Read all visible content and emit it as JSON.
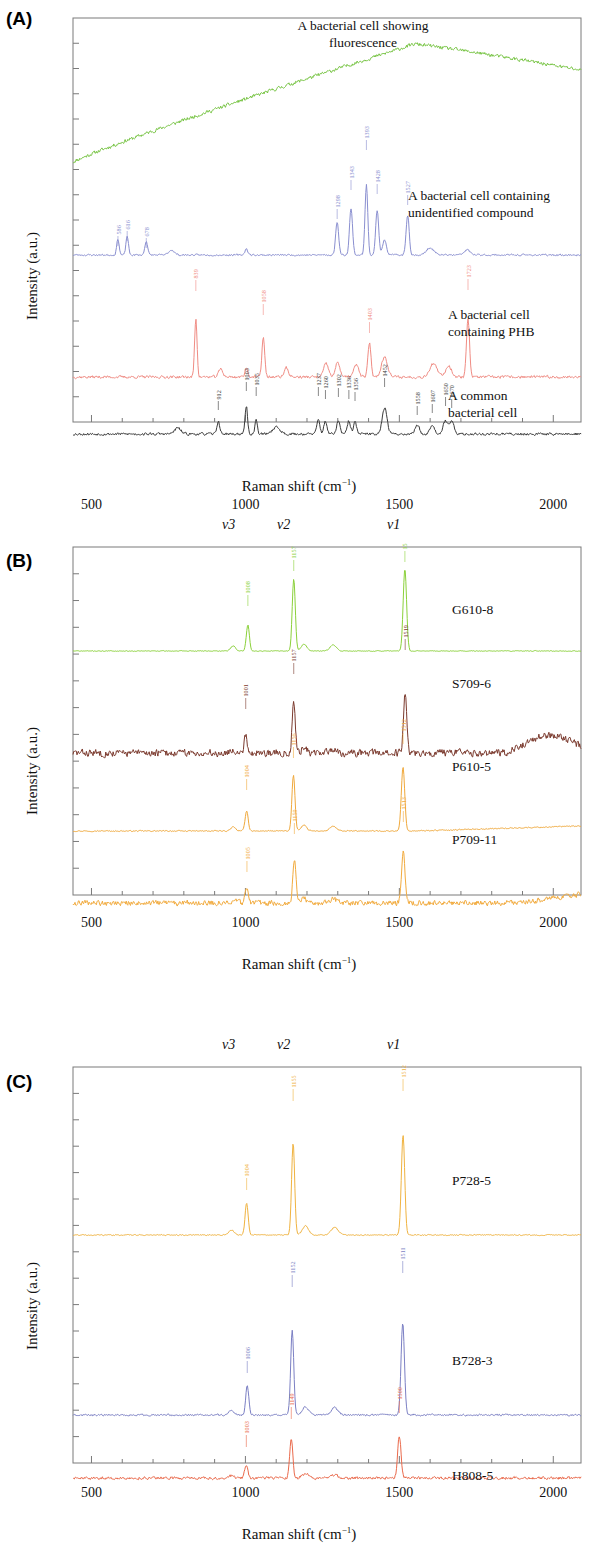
{
  "figure": {
    "axis_y_title": "Intensity (a.u.)",
    "axis_x_title_main": "Raman shift (cm",
    "axis_x_title_sup": "−1",
    "axis_x_title_tail": ")",
    "x_ticks": [
      "500",
      "1000",
      "1500",
      "2000"
    ],
    "x_range": [
      440,
      2090
    ]
  },
  "panelA": {
    "letter": "(A)",
    "series": [
      {
        "name": "A bacterial cell showing fluorescence",
        "label_lines": [
          "A bacterial cell showing",
          "fluorescence"
        ],
        "color": "#76c442",
        "peaks": []
      },
      {
        "name": "A bacterial cell containing unidentified compound",
        "label_lines": [
          "A bacterial cell containing",
          "unidentified compound"
        ],
        "color": "#8a8fd0",
        "peaks": [
          "586",
          "616",
          "678",
          "1298",
          "1343",
          "1393",
          "1428",
          "1527"
        ]
      },
      {
        "name": "A bacterial cell containing PHB",
        "label_lines": [
          "A bacterial cell",
          "containing PHB"
        ],
        "color": "#f08c84",
        "peaks": [
          "839",
          "1058",
          "1403",
          "1723"
        ]
      },
      {
        "name": "A common bacterial cell",
        "label_lines": [
          "A common",
          "bacterial cell"
        ],
        "color": "#3b3b3b",
        "peaks": [
          "912",
          "1003",
          "1035",
          "1237",
          "1260",
          "1302",
          "1336",
          "1356",
          "1452",
          "1558",
          "1607",
          "1650",
          "1670"
        ]
      }
    ]
  },
  "panelB": {
    "letter": "(B)",
    "nu_labels": [
      "v3",
      "v2",
      "v1"
    ],
    "series": [
      {
        "name": "G610-8",
        "color": "#8bd13a",
        "peaks": [
          "1008",
          "1157",
          "1518"
        ]
      },
      {
        "name": "S709-6",
        "color": "#7b3a2e",
        "peaks": [
          "1001",
          "1157",
          "1519"
        ]
      },
      {
        "name": "P610-5",
        "color": "#f0a93c",
        "peaks": [
          "1004",
          "1156",
          "1512"
        ]
      },
      {
        "name": "P709-11",
        "color": "#f2ab3e",
        "peaks": [
          "1005",
          "1159",
          "1513"
        ]
      }
    ]
  },
  "panelC": {
    "letter": "(C)",
    "nu_labels": [
      "v3",
      "v2",
      "v1"
    ],
    "series": [
      {
        "name": "P728-5",
        "color": "#f0b340",
        "peaks": [
          "1004",
          "1155",
          "1512"
        ]
      },
      {
        "name": "B728-3",
        "color": "#7b7fc4",
        "peaks": [
          "1006",
          "1152",
          "1511"
        ]
      },
      {
        "name": "H808-5",
        "color": "#ea6a4c",
        "peaks": [
          "1003",
          "1149",
          "1500"
        ]
      }
    ]
  },
  "chart_data": {
    "type": "line",
    "xlabel": "Raman shift (cm-1)",
    "ylabel": "Intensity (a.u.)",
    "xlim": [
      440,
      2090
    ],
    "xticks": [
      500,
      1000,
      1500,
      2000
    ],
    "grid": false,
    "legend": "inline-right-of-trace",
    "panels": [
      {
        "panel": "A",
        "series": [
          {
            "name": "A bacterial cell showing fluorescence",
            "color": "#76c442",
            "description": "broad fluorescence background rising from 440 to a maximum near 1550 then gently decreasing",
            "annotated_peaks": []
          },
          {
            "name": "A bacterial cell containing unidentified compound",
            "color": "#8a8fd0",
            "annotated_peaks": [
              586,
              616,
              678,
              1298,
              1343,
              1393,
              1428,
              1527
            ]
          },
          {
            "name": "A bacterial cell containing PHB",
            "color": "#f08c84",
            "annotated_peaks": [
              839,
              1058,
              1403,
              1723
            ]
          },
          {
            "name": "A common bacterial cell",
            "color": "#3b3b3b",
            "annotated_peaks": [
              912,
              1003,
              1035,
              1237,
              1260,
              1302,
              1336,
              1356,
              1452,
              1558,
              1607,
              1650,
              1670
            ]
          }
        ]
      },
      {
        "panel": "B",
        "band_markers": [
          {
            "label": "v3",
            "x": 1005
          },
          {
            "label": "v2",
            "x": 1157
          },
          {
            "label": "v1",
            "x": 1515
          }
        ],
        "series": [
          {
            "name": "G610-8",
            "color": "#8bd13a",
            "annotated_peaks": [
              1008,
              1157,
              1518
            ],
            "noise": "low"
          },
          {
            "name": "S709-6",
            "color": "#7b3a2e",
            "annotated_peaks": [
              1001,
              1157,
              1519
            ],
            "noise": "high"
          },
          {
            "name": "P610-5",
            "color": "#f0a93c",
            "annotated_peaks": [
              1004,
              1156,
              1512
            ],
            "noise": "low"
          },
          {
            "name": "P709-11",
            "color": "#f2ab3e",
            "annotated_peaks": [
              1005,
              1159,
              1513
            ],
            "noise": "high"
          }
        ]
      },
      {
        "panel": "C",
        "band_markers": [
          {
            "label": "v3",
            "x": 1005
          },
          {
            "label": "v2",
            "x": 1155
          },
          {
            "label": "v1",
            "x": 1512
          }
        ],
        "series": [
          {
            "name": "P728-5",
            "color": "#f0b340",
            "annotated_peaks": [
              1004,
              1155,
              1512
            ],
            "noise": "low"
          },
          {
            "name": "B728-3",
            "color": "#7b7fc4",
            "annotated_peaks": [
              1006,
              1152,
              1511
            ],
            "noise": "low"
          },
          {
            "name": "H808-5",
            "color": "#ea6a4c",
            "annotated_peaks": [
              1003,
              1149,
              1500
            ],
            "noise": "medium"
          }
        ]
      }
    ]
  }
}
